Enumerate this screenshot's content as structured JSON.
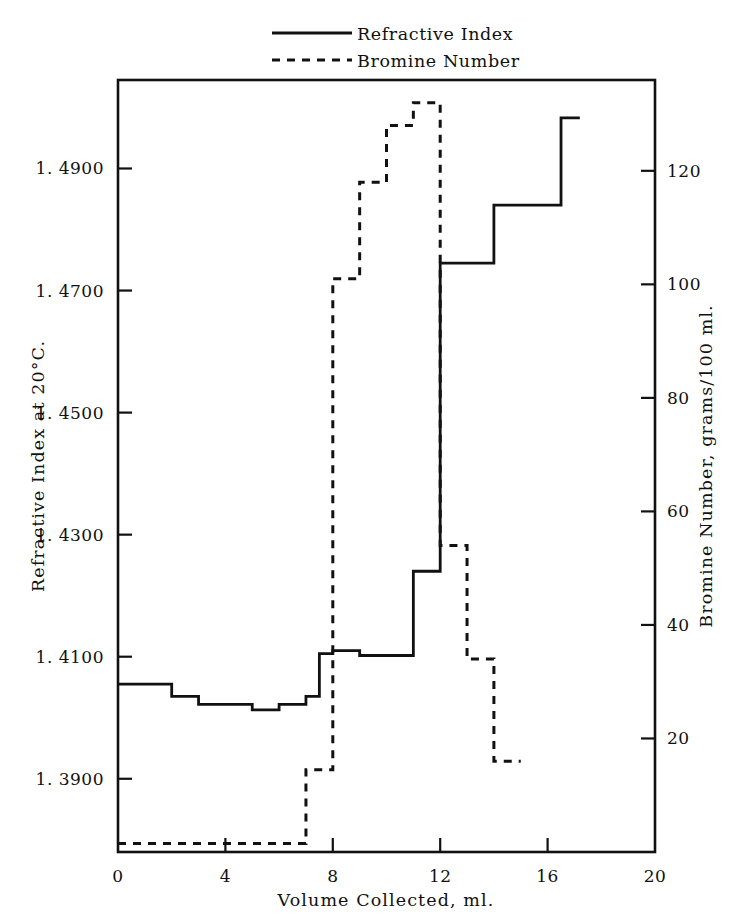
{
  "chart_data": {
    "type": "line",
    "title": "",
    "subtitle": "",
    "xlabel": "Volume Collected,  ml.",
    "ylabel": "Refractive Index at 20°C.",
    "y2label": "Bromine Number,  grams/100 ml.",
    "xlim": [
      0,
      20
    ],
    "ylim": [
      1.378,
      1.5045
    ],
    "y2lim": [
      0,
      136
    ],
    "grid": false,
    "legend_position": "top-center",
    "step_style": "post",
    "x_ticks": [
      0,
      4,
      8,
      12,
      16,
      20
    ],
    "x_tick_labels": [
      "0",
      "4",
      "8",
      "12",
      "16",
      "20"
    ],
    "y_ticks": [
      1.39,
      1.41,
      1.43,
      1.45,
      1.47,
      1.49
    ],
    "y_tick_labels": [
      "1. 3900",
      "1. 4100",
      "1. 4300",
      "1. 4500",
      "1. 4700",
      "1. 4900"
    ],
    "y2_ticks": [
      20,
      40,
      60,
      80,
      100,
      120
    ],
    "y2_tick_labels": [
      "20",
      "40",
      "60",
      "80",
      "100",
      "120"
    ],
    "series": [
      {
        "name": "Refractive Index",
        "style": "solid",
        "axis": "left",
        "x_edges": [
          0,
          2,
          3,
          5,
          6,
          7,
          7.5,
          8,
          9,
          9.5,
          11,
          11.5,
          12,
          13,
          14,
          15,
          16.5,
          17.2
        ],
        "values": [
          1.4055,
          1.4035,
          1.4022,
          1.4013,
          1.4022,
          1.4035,
          1.4105,
          1.411,
          1.4102,
          1.4102,
          1.424,
          1.424,
          1.4745,
          1.4745,
          1.484,
          1.484,
          1.4983
        ]
      },
      {
        "name": "Bromine Number",
        "style": "dashed",
        "axis": "right",
        "x_edges": [
          0,
          7,
          8,
          8.5,
          9,
          10,
          11,
          12,
          12.3,
          13,
          13.5,
          14,
          15
        ],
        "values": [
          1.5,
          14.5,
          101,
          101,
          118,
          128,
          132,
          54,
          54,
          34,
          34,
          16,
          16
        ]
      }
    ],
    "legend": [
      {
        "label": "Refractive Index",
        "style": "solid"
      },
      {
        "label": "Bromine Number",
        "style": "dashed"
      }
    ]
  },
  "geometry": {
    "plot_left": 118,
    "plot_right": 655,
    "plot_top": 80,
    "plot_bottom": 852
  }
}
